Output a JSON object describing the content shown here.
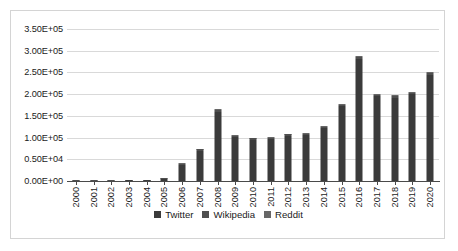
{
  "chart_data": {
    "type": "bar",
    "title": "",
    "subtitle": "",
    "xlabel": "",
    "ylabel": "",
    "stacked": true,
    "grid": true,
    "legend_position": "bottom",
    "ylim": [
      0,
      350000
    ],
    "ytick_values": [
      0,
      50000,
      100000,
      150000,
      200000,
      250000,
      300000,
      350000
    ],
    "ytick_labels": [
      "0.00E+00",
      "0.50E+04",
      "1.00E+05",
      "1.50E+05",
      "2.00E+05",
      "2.50E+05",
      "3.00E+05",
      "3.50E+05"
    ],
    "categories": [
      "2000",
      "2001",
      "2002",
      "2003",
      "2004",
      "2005",
      "2006",
      "2007",
      "2008",
      "2009",
      "2010",
      "2011",
      "2012",
      "2013",
      "2014",
      "2015",
      "2016",
      "2017",
      "2018",
      "2019",
      "2020"
    ],
    "series": [
      {
        "name": "Twitter",
        "color": "#3b3b3b",
        "values": [
          900,
          1100,
          800,
          1200,
          1400,
          5500,
          38000,
          70000,
          158000,
          101000,
          95000,
          97000,
          104000,
          105000,
          121000,
          172000,
          280000,
          195000,
          192000,
          200000,
          245000
        ]
      },
      {
        "name": "Wikipedia",
        "color": "#4f4f4f",
        "values": [
          200,
          250,
          200,
          300,
          350,
          1200,
          2000,
          3000,
          4500,
          3500,
          3000,
          3200,
          3500,
          3500,
          4000,
          4000,
          5000,
          3500,
          3500,
          3500,
          4000
        ]
      },
      {
        "name": "Reddit",
        "color": "#676767",
        "values": [
          100,
          100,
          100,
          100,
          150,
          600,
          1000,
          1500,
          2500,
          1800,
          1500,
          1600,
          1800,
          1800,
          2000,
          2000,
          2500,
          1500,
          1800,
          1800,
          2000
        ]
      }
    ],
    "totals": [
      1200,
      1450,
      1100,
      1600,
      1900,
      7300,
      41000,
      74500,
      165000,
      106300,
      99500,
      101800,
      109300,
      110300,
      127000,
      178000,
      287500,
      200000,
      197300,
      205300,
      251000
    ]
  },
  "legend": {
    "items": [
      {
        "label": "Twitter",
        "color": "#3b3b3b"
      },
      {
        "label": "Wikipedia",
        "color": "#4f4f4f"
      },
      {
        "label": "Reddit",
        "color": "#676767"
      }
    ]
  },
  "colors": {
    "plot_background": "#ffffff",
    "frame_border": "#d4d4d4",
    "gridline": "#d9d9d9",
    "axis_line": "#4a4a4a",
    "text": "#1a1a1a"
  }
}
